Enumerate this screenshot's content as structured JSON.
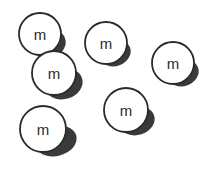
{
  "scene": {
    "title": "molecule-circles-diagram",
    "width": 216,
    "height": 177,
    "background_color": "#ffffff",
    "outline_color": "#2b2b2b",
    "shadow_color": "#3a3a3a",
    "fill_color": "#ffffff",
    "text_color": "#2b2b2b",
    "count_label": "6"
  },
  "circles": [
    {
      "id": "circle-1",
      "name": "circle-top-left",
      "label": "m",
      "cx": 40,
      "cy": 34,
      "r": 21,
      "stroke": 1.8,
      "font_size": 15,
      "shadow": {
        "cx": 49,
        "cy": 44,
        "rx": 17,
        "ry": 14,
        "rot": -20
      }
    },
    {
      "id": "circle-2",
      "name": "circle-mid-left",
      "label": "m",
      "cx": 54,
      "cy": 73,
      "r": 22,
      "stroke": 1.8,
      "font_size": 15,
      "shadow": {
        "cx": 64,
        "cy": 84,
        "rx": 19,
        "ry": 15,
        "rot": -18
      }
    },
    {
      "id": "circle-3",
      "name": "circle-top-middle",
      "label": "m",
      "cx": 106,
      "cy": 43,
      "r": 21,
      "stroke": 1.8,
      "font_size": 15,
      "shadow": {
        "cx": 115,
        "cy": 53,
        "rx": 16,
        "ry": 13,
        "rot": -20
      }
    },
    {
      "id": "circle-4",
      "name": "circle-right",
      "label": "m",
      "cx": 173,
      "cy": 63,
      "r": 21,
      "stroke": 1.8,
      "font_size": 15,
      "shadow": {
        "cx": 183,
        "cy": 73,
        "rx": 16,
        "ry": 13,
        "rot": -20
      }
    },
    {
      "id": "circle-5",
      "name": "circle-bottom-middle",
      "label": "m",
      "cx": 126,
      "cy": 110,
      "r": 22,
      "stroke": 1.8,
      "font_size": 15,
      "shadow": {
        "cx": 137,
        "cy": 121,
        "rx": 18,
        "ry": 14,
        "rot": -18
      }
    },
    {
      "id": "circle-6",
      "name": "circle-bottom-left",
      "label": "m",
      "cx": 43,
      "cy": 129,
      "r": 23,
      "stroke": 1.8,
      "font_size": 15,
      "shadow": {
        "cx": 56,
        "cy": 141,
        "rx": 21,
        "ry": 15,
        "rot": -15
      }
    }
  ]
}
